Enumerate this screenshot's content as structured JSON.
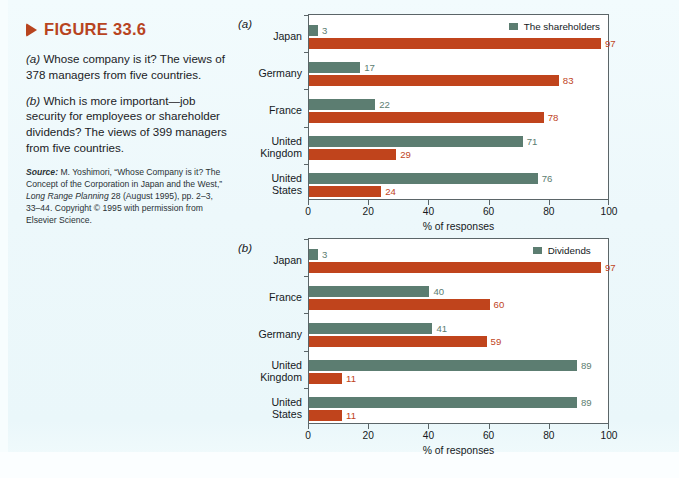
{
  "figure": {
    "marker_icon": "triangle-right-icon",
    "title": "FIGURE 33.6",
    "paragraph_a_prefix": "(a)",
    "paragraph_a": " Whose company is it? The views of 378 managers from five countries.",
    "paragraph_b_prefix": "(b)",
    "paragraph_b": " Which is more important—job security for employees or shareholder dividends? The views of 399 managers from five countries.",
    "source_label": "Source:",
    "source_text_1": " M. Yoshimori, “Whose Company is it? The Concept of the Corporation in Japan and the West,” ",
    "source_italic": "Long Range Planning",
    "source_text_2": " 28 (August 1995), pp. 2–3, 33–44. Copyright © 1995 with permission from Elsevier Science."
  },
  "colors": {
    "accent": "#b8441f",
    "series_green": "#5c7d71",
    "series_red": "#c0441c",
    "page_bg": "#eef9fb",
    "plot_bg": "#ffffff",
    "axis": "#5b6568"
  },
  "chart_data": [
    {
      "type": "bar",
      "orientation": "horizontal",
      "panel": "(a)",
      "title": "",
      "xlabel": "% of responses",
      "ylabel": "",
      "xlim": [
        0,
        100
      ],
      "xticks": [
        0,
        20,
        40,
        60,
        80,
        100
      ],
      "grid": false,
      "legend_position": "top-right",
      "categories": [
        "Japan",
        "Germany",
        "France",
        "United Kingdom",
        "United States"
      ],
      "series": [
        {
          "name": "The shareholders",
          "color": "#5c7d71",
          "values": [
            3,
            17,
            22,
            71,
            76
          ]
        },
        {
          "name": "All stakeholders",
          "color": "#c0441c",
          "values": [
            97,
            83,
            78,
            29,
            24
          ]
        }
      ]
    },
    {
      "type": "bar",
      "orientation": "horizontal",
      "panel": "(b)",
      "title": "",
      "xlabel": "% of responses",
      "ylabel": "",
      "xlim": [
        0,
        100
      ],
      "xticks": [
        0,
        20,
        40,
        60,
        80,
        100
      ],
      "grid": false,
      "legend_position": "top-right",
      "categories": [
        "Japan",
        "France",
        "Germany",
        "United Kingdom",
        "United States"
      ],
      "series": [
        {
          "name": "Dividends",
          "color": "#5c7d71",
          "values": [
            3,
            40,
            41,
            89,
            89
          ]
        },
        {
          "name": "Job security",
          "color": "#c0441c",
          "values": [
            97,
            60,
            59,
            11,
            11
          ]
        }
      ]
    }
  ]
}
